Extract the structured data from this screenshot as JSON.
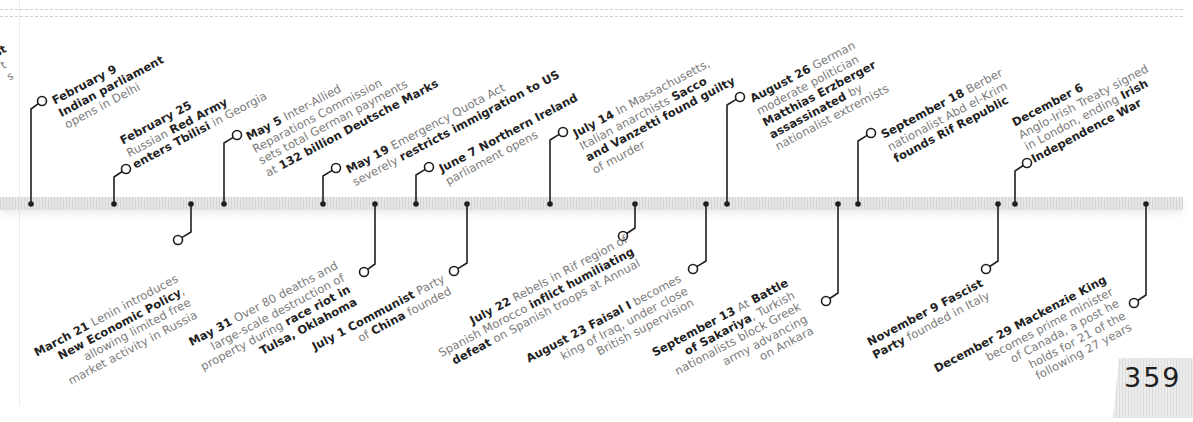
{
  "page": {
    "number": "359"
  },
  "colors": {
    "ink": "#1f1f1f",
    "muted": "#7a7a7a",
    "band": "#e0e0e0"
  },
  "timeline": {
    "axis_y": 204,
    "events_above": [
      {
        "date": "February 9",
        "dot_x": 31,
        "circle": [
          42,
          101
        ],
        "lines": [
          [
            [
              "February 9",
              true
            ]
          ],
          [
            [
              "Indian parliament",
              true
            ]
          ],
          [
            [
              "opens in Delhi",
              false
            ]
          ]
        ],
        "text_pos": [
          50,
          96
        ]
      },
      {
        "date": "February 25",
        "dot_x": 114,
        "circle": [
          126,
          169
        ],
        "lines": [
          [
            [
              "February 25",
              true
            ]
          ],
          [
            [
              "Russian ",
              false
            ],
            [
              "Red Army",
              true
            ]
          ],
          [
            [
              "enters Tbilisi",
              true
            ],
            [
              " in Georgia",
              false
            ]
          ]
        ],
        "text_pos": [
          118,
          136
        ]
      },
      {
        "date": "May 5",
        "dot_x": 224,
        "circle": [
          237,
          135
        ],
        "lines": [
          [
            [
              "May 5",
              true
            ],
            [
              " Inter-Allied",
              false
            ]
          ],
          [
            [
              "Reparations Commission",
              false
            ]
          ],
          [
            [
              "sets total German payments",
              false
            ]
          ],
          [
            [
              "at ",
              false
            ],
            [
              "132 billion Deutsche Marks",
              true
            ]
          ]
        ],
        "text_pos": [
          244,
          132
        ]
      },
      {
        "date": "May 19",
        "dot_x": 323,
        "circle": [
          336,
          168
        ],
        "lines": [
          [
            [
              "May 19",
              true
            ],
            [
              " Emergency Quota Act",
              false
            ]
          ],
          [
            [
              "severely ",
              false
            ],
            [
              "restricts immigration to US",
              true
            ]
          ]
        ],
        "text_pos": [
          344,
          165
        ]
      },
      {
        "date": "June 7",
        "dot_x": 416,
        "circle": [
          429,
          167
        ],
        "lines": [
          [
            [
              "June 7",
              true
            ],
            [
              " Northern Ireland",
              true
            ]
          ],
          [
            [
              "parliament opens",
              false
            ]
          ]
        ],
        "text_pos": [
          437,
          164
        ]
      },
      {
        "date": "July 14",
        "dot_x": 550,
        "circle": [
          563,
          132
        ],
        "lines": [
          [
            [
              "July 14",
              true
            ],
            [
              " In Massachusetts,",
              false
            ]
          ],
          [
            [
              "Italian anarchists ",
              false
            ],
            [
              "Sacco",
              true
            ]
          ],
          [
            [
              "and Vanzetti found guilty",
              true
            ]
          ],
          [
            [
              "of murder",
              false
            ]
          ]
        ],
        "text_pos": [
          571,
          129
        ]
      },
      {
        "date": "August 26",
        "dot_x": 727,
        "circle": [
          740,
          97
        ],
        "lines": [
          [
            [
              "August 26",
              true
            ],
            [
              " German",
              false
            ]
          ],
          [
            [
              "moderate politician",
              false
            ]
          ],
          [
            [
              "Matthias Erzberger",
              true
            ]
          ],
          [
            [
              "assassinated",
              true
            ],
            [
              " by",
              false
            ]
          ],
          [
            [
              "nationalist extremists",
              false
            ]
          ]
        ],
        "text_pos": [
          748,
          94
        ]
      },
      {
        "date": "September 18",
        "dot_x": 858,
        "circle": [
          871,
          133
        ],
        "lines": [
          [
            [
              "September 18",
              true
            ],
            [
              " Berber",
              false
            ]
          ],
          [
            [
              "nationalist Abd el-Krim",
              false
            ]
          ],
          [
            [
              "founds Rif Republic",
              true
            ]
          ]
        ],
        "text_pos": [
          879,
          130
        ]
      },
      {
        "date": "December 6",
        "dot_x": 1015,
        "circle": [
          1027,
          163
        ],
        "lines": [
          [
            [
              "December 6",
              true
            ]
          ],
          [
            [
              "Anglo-Irish Treaty signed",
              false
            ]
          ],
          [
            [
              "in London, ending ",
              false
            ],
            [
              "Irish",
              true
            ]
          ],
          [
            [
              "Independence War",
              true
            ]
          ]
        ],
        "text_pos": [
          1010,
          118
        ]
      }
    ],
    "events_below": [
      {
        "date": "March 21",
        "dot_x": 191,
        "circle": [
          178,
          240
        ],
        "lines": [
          [
            [
              "March 21",
              true
            ],
            [
              " Lenin introduces",
              false
            ]
          ],
          [
            [
              "New Economic Policy",
              true
            ],
            [
              ",",
              false
            ]
          ],
          [
            [
              "allowing limited free",
              false
            ]
          ],
          [
            [
              "market activity in Russia",
              false
            ]
          ]
        ],
        "text_pos": [
          32,
          348
        ]
      },
      {
        "date": "May 31",
        "dot_x": 375,
        "circle": [
          364,
          272
        ],
        "lines": [
          [
            [
              "May 31",
              true
            ],
            [
              " Over 80 deaths and",
              false
            ]
          ],
          [
            [
              "large-scale destruction of",
              false
            ]
          ],
          [
            [
              "property during ",
              false
            ],
            [
              "race riot in",
              true
            ]
          ],
          [
            [
              "Tulsa, Oklahoma",
              true
            ]
          ]
        ],
        "text_pos": [
          186,
          338
        ]
      },
      {
        "date": "July 1",
        "dot_x": 467,
        "circle": [
          454,
          271
        ],
        "lines": [
          [
            [
              "July 1",
              true
            ],
            [
              " Communist",
              true
            ],
            [
              " Party",
              false
            ]
          ],
          [
            [
              "of ",
              false
            ],
            [
              "China",
              true
            ],
            [
              " founded",
              false
            ]
          ]
        ],
        "text_pos": [
          310,
          342
        ]
      },
      {
        "date": "July 22",
        "dot_x": 635,
        "circle": [
          623,
          236
        ],
        "lines": [
          [
            [
              "July 22",
              true
            ],
            [
              " Rebels in Rif region of",
              false
            ]
          ],
          [
            [
              "Spanish Morocco ",
              false
            ],
            [
              "inflict humiliating",
              true
            ]
          ],
          [
            [
              "defeat",
              true
            ],
            [
              " on Spanish troops at Annual",
              false
            ]
          ]
        ],
        "text_pos": [
          430,
          336
        ]
      },
      {
        "date": "August 23",
        "dot_x": 706,
        "circle": [
          693,
          269
        ],
        "lines": [
          [
            [
              "August 23",
              true
            ],
            [
              " Faisal I",
              true
            ],
            [
              " becomes",
              false
            ]
          ],
          [
            [
              "king of Iraq, under close",
              false
            ]
          ],
          [
            [
              "British supervision",
              false
            ]
          ]
        ],
        "text_pos": [
          524,
          354
        ]
      },
      {
        "date": "September 13",
        "dot_x": 838,
        "circle": [
          826,
          301
        ],
        "lines": [
          [
            [
              "September 13",
              true
            ],
            [
              " At ",
              false
            ],
            [
              "Battle",
              true
            ]
          ],
          [
            [
              "of Sakariya",
              true
            ],
            [
              ", Turkish",
              false
            ]
          ],
          [
            [
              "nationalists block Greek",
              false
            ]
          ],
          [
            [
              "army advancing",
              false
            ]
          ],
          [
            [
              "on Ankara",
              false
            ]
          ]
        ],
        "text_pos": [
          650,
          348
        ]
      },
      {
        "date": "November 9",
        "dot_x": 998,
        "circle": [
          986,
          269
        ],
        "lines": [
          [
            [
              "November 9",
              true
            ],
            [
              " Fascist",
              true
            ]
          ],
          [
            [
              "Party",
              true
            ],
            [
              " founded in Italy",
              false
            ]
          ]
        ],
        "text_pos": [
          864,
          338
        ]
      },
      {
        "date": "December 29",
        "dot_x": 1146,
        "circle": [
          1134,
          303
        ],
        "lines": [
          [
            [
              "December 29",
              true
            ],
            [
              " Mackenzie King",
              true
            ]
          ],
          [
            [
              "becomes prime minister",
              false
            ]
          ],
          [
            [
              "of Canada, a post he",
              false
            ]
          ],
          [
            [
              "holds for 21 of the",
              false
            ]
          ],
          [
            [
              "following 27 years",
              false
            ]
          ]
        ],
        "text_pos": [
          932,
          364
        ]
      }
    ],
    "cropped_fragment": {
      "lines": [
        "st",
        "t",
        "s"
      ]
    }
  }
}
